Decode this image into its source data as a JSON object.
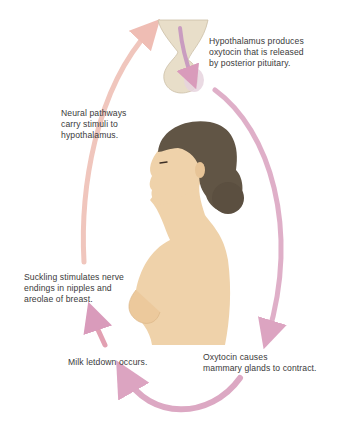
{
  "diagram": {
    "labels": [
      {
        "id": "hypothalamus",
        "text": "Hypothalamus produces\noxytocin that is released\nby posterior pituitary."
      },
      {
        "id": "neural",
        "text": "Neural pathways\ncarry stimuli to\nhypothalamus."
      },
      {
        "id": "suckling",
        "text": "Suckling stimulates nerve\nendings in nipples and\nareolae of breast."
      },
      {
        "id": "letdown",
        "text": "Milk letdown occurs."
      },
      {
        "id": "oxytocin",
        "text": "Oxytocin causes\nmammary glands to contract."
      }
    ],
    "colors": {
      "arrow_pink": "#d9a3bf",
      "arrow_peach": "#eebab0",
      "skin": "#edcfa6",
      "hair": "#5e5243",
      "pituitary": "#e4d9c4"
    }
  }
}
